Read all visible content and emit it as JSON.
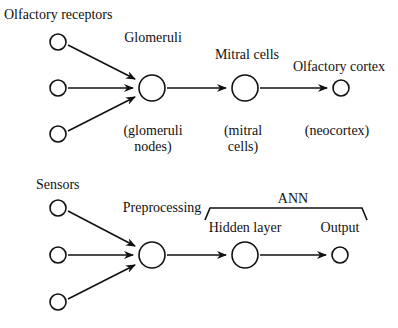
{
  "top": {
    "input_label": "Olfactory receptors",
    "stage1_label": "Glomeruli",
    "stage2_label": "Mitral cells",
    "stage3_label": "Olfactory cortex",
    "stage1_sub_line1": "(glomeruli",
    "stage1_sub_line2": "nodes)",
    "stage2_sub_line1": "(mitral",
    "stage2_sub_line2": "cells)",
    "stage3_sub": "(neocortex)"
  },
  "bottom": {
    "input_label": "Sensors",
    "stage1_label": "Preprocessing",
    "group_label": "ANN",
    "stage2_label": "Hidden layer",
    "stage3_label": "Output"
  }
}
